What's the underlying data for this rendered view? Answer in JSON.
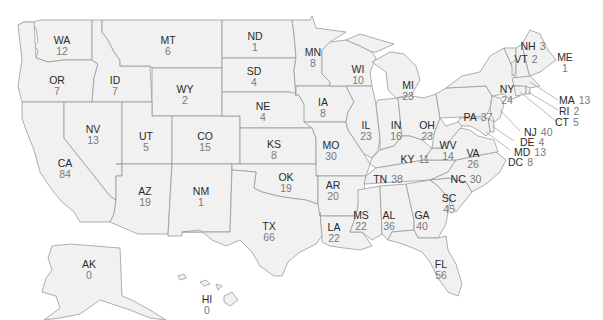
{
  "map": {
    "type": "choropleth-labels",
    "region": "United States",
    "fill_color": "#f1f1f1",
    "border_color": "#9a9a9a",
    "label_color": "#2a2a2a",
    "value_color": "#7a7a7a"
  },
  "states": {
    "WA": {
      "abbr": "WA",
      "value": "12"
    },
    "OR": {
      "abbr": "OR",
      "value": "7"
    },
    "CA": {
      "abbr": "CA",
      "value": "84"
    },
    "ID": {
      "abbr": "ID",
      "value": "7"
    },
    "NV": {
      "abbr": "NV",
      "value": "13"
    },
    "MT": {
      "abbr": "MT",
      "value": "6"
    },
    "WY": {
      "abbr": "WY",
      "value": "2"
    },
    "UT": {
      "abbr": "UT",
      "value": "5"
    },
    "AZ": {
      "abbr": "AZ",
      "value": "19"
    },
    "CO": {
      "abbr": "CO",
      "value": "15"
    },
    "NM": {
      "abbr": "NM",
      "value": "1"
    },
    "ND": {
      "abbr": "ND",
      "value": "1"
    },
    "SD": {
      "abbr": "SD",
      "value": "4"
    },
    "NE": {
      "abbr": "NE",
      "value": "4"
    },
    "KS": {
      "abbr": "KS",
      "value": "8"
    },
    "OK": {
      "abbr": "OK",
      "value": "19"
    },
    "TX": {
      "abbr": "TX",
      "value": "66"
    },
    "MN": {
      "abbr": "MN",
      "value": "8"
    },
    "IA": {
      "abbr": "IA",
      "value": "8"
    },
    "MO": {
      "abbr": "MO",
      "value": "30"
    },
    "AR": {
      "abbr": "AR",
      "value": "20"
    },
    "LA": {
      "abbr": "LA",
      "value": "22"
    },
    "WI": {
      "abbr": "WI",
      "value": "10"
    },
    "IL": {
      "abbr": "IL",
      "value": "23"
    },
    "MI": {
      "abbr": "MI",
      "value": "23"
    },
    "IN": {
      "abbr": "IN",
      "value": "16"
    },
    "OH": {
      "abbr": "OH",
      "value": "23"
    },
    "KY": {
      "abbr": "KY",
      "value": "11"
    },
    "TN": {
      "abbr": "TN",
      "value": "38"
    },
    "MS": {
      "abbr": "MS",
      "value": "22"
    },
    "AL": {
      "abbr": "AL",
      "value": "36"
    },
    "GA": {
      "abbr": "GA",
      "value": "40"
    },
    "FL": {
      "abbr": "FL",
      "value": "56"
    },
    "SC": {
      "abbr": "SC",
      "value": "45"
    },
    "NC": {
      "abbr": "NC",
      "value": "30"
    },
    "VA": {
      "abbr": "VA",
      "value": "26"
    },
    "WV": {
      "abbr": "WV",
      "value": "14"
    },
    "PA": {
      "abbr": "PA",
      "value": "37"
    },
    "NY": {
      "abbr": "NY",
      "value": "24"
    },
    "VT": {
      "abbr": "VT",
      "value": "2"
    },
    "NH": {
      "abbr": "NH",
      "value": "3"
    },
    "ME": {
      "abbr": "ME",
      "value": "1"
    },
    "MA": {
      "abbr": "MA",
      "value": "13"
    },
    "RI": {
      "abbr": "RI",
      "value": "2"
    },
    "CT": {
      "abbr": "CT",
      "value": "5"
    },
    "NJ": {
      "abbr": "NJ",
      "value": "40"
    },
    "DE": {
      "abbr": "DE",
      "value": "4"
    },
    "MD": {
      "abbr": "MD",
      "value": "13"
    },
    "DC": {
      "abbr": "DC",
      "value": "8"
    },
    "AK": {
      "abbr": "AK",
      "value": "0"
    },
    "HI": {
      "abbr": "HI",
      "value": "0"
    }
  }
}
